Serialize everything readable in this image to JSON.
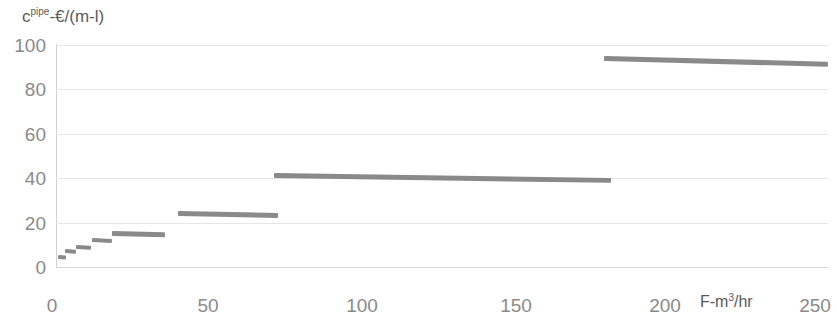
{
  "title_sliver": "",
  "axes": {
    "ylabel_main": "c",
    "ylabel_sup": "pipe",
    "ylabel_rest": "-€/(m-l)",
    "xlabel_main": "F-m",
    "xlabel_sup": "3",
    "xlabel_rest": "/hr",
    "yticks": [
      "100",
      "80",
      "60",
      "40",
      "20",
      "0"
    ],
    "xticks": [
      "0",
      "50",
      "100",
      "150",
      "200",
      "250"
    ]
  },
  "chart_data": {
    "type": "line",
    "title": "",
    "xlabel": "F-m3/hr",
    "ylabel": "cpipe-€/(m-l)",
    "xlim": [
      0,
      250
    ],
    "ylim": [
      0,
      100
    ],
    "xticks": [
      0,
      50,
      100,
      150,
      200,
      250
    ],
    "yticks": [
      0,
      20,
      40,
      60,
      80,
      100
    ],
    "grid": true,
    "legend": false,
    "series": [
      {
        "name": "pipe cost tiers",
        "color": "#808080",
        "segments": [
          {
            "tier": 1,
            "x_start": 0.5,
            "x_end": 3.0,
            "y_start": 4.5,
            "y_end": 4.2
          },
          {
            "tier": 2,
            "x_start": 3.0,
            "x_end": 6.5,
            "y_start": 6.8,
            "y_end": 6.4
          },
          {
            "tier": 3,
            "x_start": 6.5,
            "x_end": 11.5,
            "y_start": 9.0,
            "y_end": 8.6
          },
          {
            "tier": 4,
            "x_start": 11.5,
            "x_end": 18.0,
            "y_start": 12.0,
            "y_end": 11.5
          },
          {
            "tier": 5,
            "x_start": 18.0,
            "x_end": 35.0,
            "y_start": 15.2,
            "y_end": 14.6
          },
          {
            "tier": 6,
            "x_start": 39.5,
            "x_end": 72.0,
            "y_start": 24.2,
            "y_end": 23.3
          },
          {
            "tier": 7,
            "x_start": 70.5,
            "x_end": 179.5,
            "y_start": 41.0,
            "y_end": 38.8
          },
          {
            "tier": 8,
            "x_start": 177.5,
            "x_end": 250.0,
            "y_start": 93.8,
            "y_end": 91.2
          }
        ]
      }
    ]
  }
}
